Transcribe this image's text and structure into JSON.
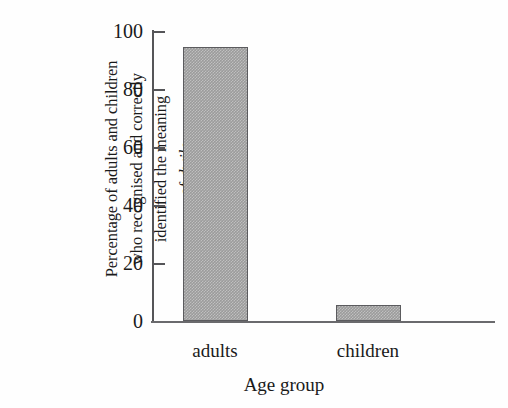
{
  "chart_data": {
    "type": "bar",
    "title": "",
    "subtitle": "",
    "categories": [
      "adults",
      "children"
    ],
    "values": [
      94.5,
      5.5
    ],
    "series": [
      {
        "name": "Percentage correctly identified",
        "values": [
          94.5,
          5.5
        ]
      }
    ],
    "xlabel": "Age group",
    "ylabel": "Percentage of adults and children who recognised and correctly identified the meaning of dwile",
    "ylabel_lines": [
      "Percentage of adults and children",
      "who recognised and correctly",
      "identified the meaning",
      "of dwile"
    ],
    "ylabel_italic_word": "dwile",
    "ylim": [
      0,
      100
    ],
    "yticks": [
      0,
      20,
      40,
      60,
      80,
      100
    ],
    "ytick_labels": [
      "0",
      "20",
      "40",
      "60",
      "80",
      "100"
    ],
    "xlim_categories": 2,
    "grid": false,
    "legend": false,
    "legend_position": "none",
    "bar_fill_color": "#9b9b9b",
    "bar_edge_color": "#5b5b5e",
    "axis_color": "#555558",
    "text_color": "#1a1a1a",
    "background_color": "#fefefe",
    "bar_fill_pattern": "gray-dither-checker",
    "tick_direction": "in"
  }
}
